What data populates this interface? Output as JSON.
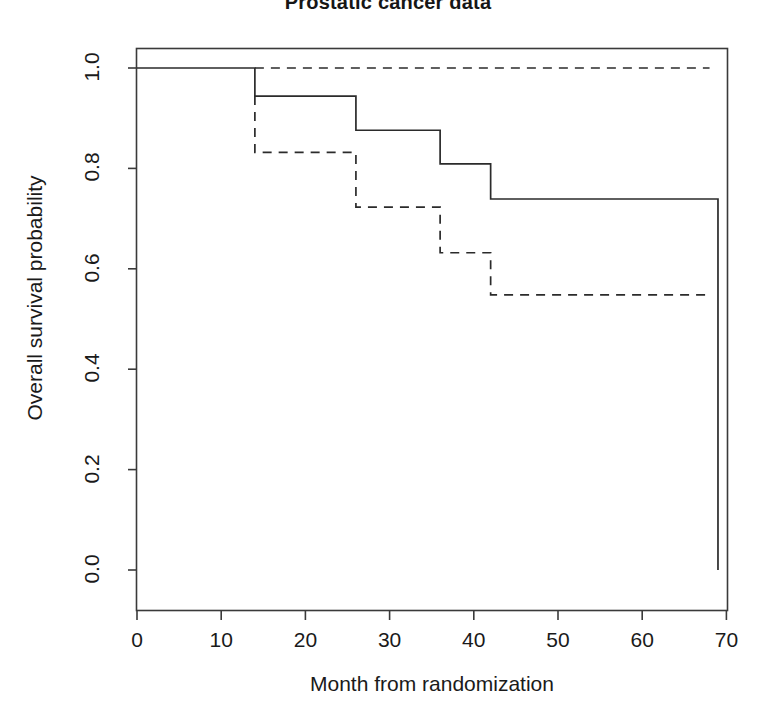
{
  "chart_data": {
    "type": "line",
    "title": "Prostatic cancer data",
    "xlabel": "Month from randomization",
    "ylabel": "Overall survival probability",
    "xlim": [
      -2,
      73
    ],
    "ylim": [
      -0.01,
      1.04
    ],
    "xticks": [
      0,
      10,
      20,
      30,
      40,
      50,
      60,
      70
    ],
    "xticklabels": [
      "0",
      "10",
      "20",
      "30",
      "40",
      "50",
      "60",
      "70"
    ],
    "yticks": [
      0.0,
      0.2,
      0.4,
      0.6,
      0.8,
      1.0
    ],
    "yticklabels": [
      "0.0",
      "0.2",
      "0.4",
      "0.6",
      "0.8",
      "1.0"
    ],
    "grid": false,
    "legend": "none",
    "series": [
      {
        "name": "solid-survival-curve",
        "style": "solid",
        "color": "#2b2b2b",
        "step": "post",
        "x": [
          0,
          14,
          14,
          26,
          26,
          36,
          36,
          42,
          42,
          69,
          69
        ],
        "y": [
          1.0,
          1.0,
          0.944,
          0.944,
          0.876,
          0.876,
          0.809,
          0.809,
          0.739,
          0.739,
          0.0
        ]
      },
      {
        "name": "dashed-upper-curve",
        "style": "dashed",
        "color": "#2b2b2b",
        "step": "post",
        "x": [
          14,
          68
        ],
        "y": [
          1.0,
          1.0
        ]
      },
      {
        "name": "dashed-lower-curve",
        "style": "dashed",
        "color": "#2b2b2b",
        "step": "post",
        "x": [
          14,
          14,
          26,
          26,
          36,
          36,
          42,
          42,
          68
        ],
        "y": [
          0.944,
          0.832,
          0.832,
          0.723,
          0.723,
          0.632,
          0.632,
          0.548,
          0.548
        ]
      }
    ]
  }
}
